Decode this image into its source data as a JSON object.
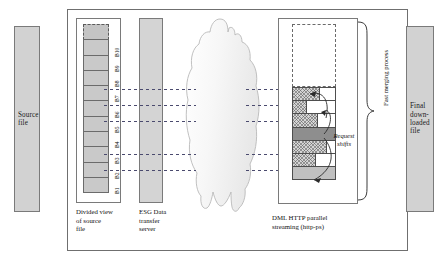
{
  "diagram": {
    "source_file": {
      "label": "Source\nfile"
    },
    "final_file": {
      "label": "Final\ndown-\nloaded\nfile"
    },
    "divided_view": {
      "caption": "Divided view\nof source\nfile",
      "blocks": [
        {
          "id": "pending",
          "label": "",
          "state": "pending"
        },
        {
          "id": "B10",
          "label": "B10",
          "state": "allocated"
        },
        {
          "id": "B9",
          "label": "B9",
          "state": "allocated"
        },
        {
          "id": "B8",
          "label": "B8",
          "state": "allocated"
        },
        {
          "id": "B7",
          "label": "B7",
          "state": "allocated"
        },
        {
          "id": "B6",
          "label": "B6",
          "state": "allocated"
        },
        {
          "id": "B5",
          "label": "B5",
          "state": "allocated"
        },
        {
          "id": "B4",
          "label": "B4",
          "state": "allocated"
        },
        {
          "id": "B3",
          "label": "B3",
          "state": "allocated"
        },
        {
          "id": "B2",
          "label": "B2",
          "state": "allocated"
        },
        {
          "id": "B1",
          "label": "B1",
          "state": "allocated"
        }
      ]
    },
    "esg_server": {
      "caption": "ESG Data\ntransfer\nserver"
    },
    "network_cloud": {
      "name": "network-cloud"
    },
    "streaming": {
      "caption": "DML HTTP parallel\nstreaming (http-ps)",
      "pending_region_label": "",
      "bars": [
        {
          "index": 1,
          "fill_percent": 62,
          "style": "hatch"
        },
        {
          "index": 2,
          "fill_percent": 30,
          "style": "hatch"
        },
        {
          "index": 3,
          "fill_percent": 58,
          "style": "hatch"
        },
        {
          "index": 4,
          "fill_percent": 100,
          "style": "solid"
        },
        {
          "index": 5,
          "fill_percent": 78,
          "style": "hatch"
        },
        {
          "index": 6,
          "fill_percent": 52,
          "style": "hatch"
        },
        {
          "index": 7,
          "fill_percent": 100,
          "style": "light"
        }
      ]
    },
    "connections": {
      "name": "parallel-request-streams",
      "from_blocks": [
        "B7",
        "B6",
        "B5",
        "B3",
        "B2"
      ],
      "style": "dashed-arrow"
    },
    "request_shifts": {
      "label": "Request\nshifts"
    },
    "merging": {
      "label": "Fast merging process"
    },
    "colors": {
      "slab_fill": "#d2d2d2",
      "block_fill": "#c9c9c9",
      "bar_solid": "#8e8e8e",
      "bar_light": "#c0c0c0",
      "frame_stroke": "#6f6f6f",
      "connector": "#4a4a6e"
    }
  }
}
